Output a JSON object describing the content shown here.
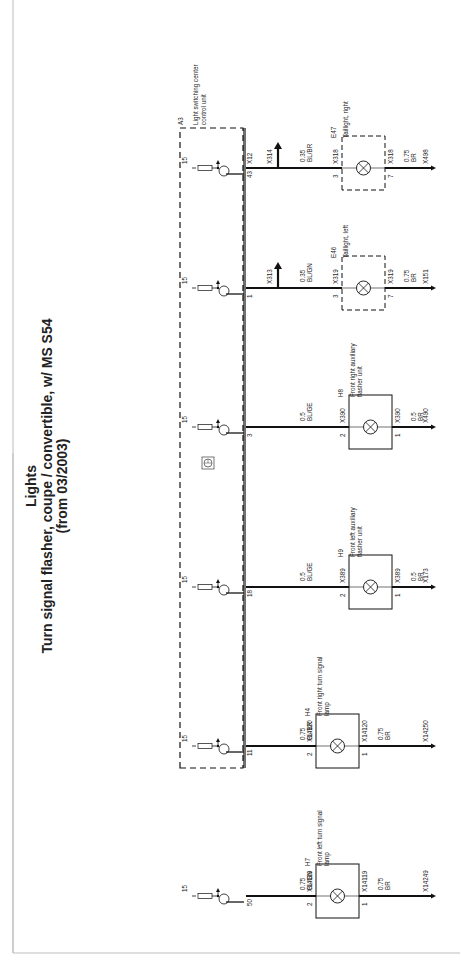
{
  "title": {
    "line1": "Lights",
    "line2": "Turn signal flasher, coupe / convertible, w/ MS S54",
    "line3": "(from 03/2003)"
  },
  "control_unit": {
    "id": "A3",
    "name_line1": "Light switching center",
    "name_line2": "control unit",
    "terminal_label": "15",
    "ground_symbol": "ground-symbol-icon"
  },
  "circuits": [
    {
      "pin": "43",
      "unit_connector": "X12",
      "branch_connector": "X314",
      "wire_size": "0.35",
      "wire_color": "BL/BR",
      "comp_id": "E47",
      "comp_name_line1": "Taillight, right",
      "comp_name_line2": "",
      "comp_in_conn": "X318",
      "comp_in_pin": "3",
      "comp_out_conn": "X318",
      "comp_out_pin": "7",
      "gnd_wire_size": "0.75",
      "gnd_wire_color": "BR",
      "ground": "X498",
      "dashed": true
    },
    {
      "pin": "1",
      "unit_connector": "",
      "branch_connector": "X313",
      "wire_size": "0.35",
      "wire_color": "BL/GN",
      "comp_id": "E46",
      "comp_name_line1": "Taillight, left",
      "comp_name_line2": "",
      "comp_in_conn": "X319",
      "comp_in_pin": "3",
      "comp_out_conn": "X319",
      "comp_out_pin": "7",
      "gnd_wire_size": "0.75",
      "gnd_wire_color": "BR",
      "ground": "X151",
      "dashed": true
    },
    {
      "pin": "3",
      "unit_connector": "",
      "branch_connector": "",
      "wire_size": "0.5",
      "wire_color": "BL/GE",
      "comp_id": "H8",
      "comp_name_line1": "Front right auxiliary",
      "comp_name_line2": "flasher unit",
      "comp_in_conn": "X390",
      "comp_in_pin": "2",
      "comp_out_conn": "X390",
      "comp_out_pin": "1",
      "gnd_wire_size": "0.5",
      "gnd_wire_color": "BR",
      "ground": "X490",
      "dashed": false
    },
    {
      "pin": "18",
      "unit_connector": "",
      "branch_connector": "",
      "wire_size": "0.5",
      "wire_color": "BL/GE",
      "comp_id": "H9",
      "comp_name_line1": "Front left auxiliary",
      "comp_name_line2": "flasher unit",
      "comp_in_conn": "X389",
      "comp_in_pin": "2",
      "comp_out_conn": "X389",
      "comp_out_pin": "1",
      "gnd_wire_size": "0.5",
      "gnd_wire_color": "BR",
      "ground": "X173",
      "dashed": false
    },
    {
      "pin": "11",
      "unit_connector": "",
      "branch_connector": "",
      "wire_size": "0.75",
      "wire_color": "BL/BR",
      "comp_id": "H4",
      "comp_name_line1": "Front right turn signal",
      "comp_name_line2": "lamp",
      "comp_in_conn": "X14120",
      "comp_in_pin": "2",
      "comp_out_conn": "X14120",
      "comp_out_pin": "1",
      "gnd_wire_size": "0.75",
      "gnd_wire_color": "BR",
      "ground": "X14250",
      "dashed": false
    },
    {
      "pin": "50",
      "unit_connector": "",
      "branch_connector": "",
      "wire_size": "0.75",
      "wire_color": "BL/GN",
      "comp_id": "H7",
      "comp_name_line1": "Front left turn signal",
      "comp_name_line2": "lamp",
      "comp_in_conn": "X14119",
      "comp_in_pin": "2",
      "comp_out_conn": "X14119",
      "comp_out_pin": "1",
      "gnd_wire_size": "0.75",
      "gnd_wire_color": "BR",
      "ground": "X14249",
      "dashed": false
    }
  ],
  "colors": {
    "line": "#111111",
    "frame": "#bdbdbd",
    "text": "#222222"
  }
}
